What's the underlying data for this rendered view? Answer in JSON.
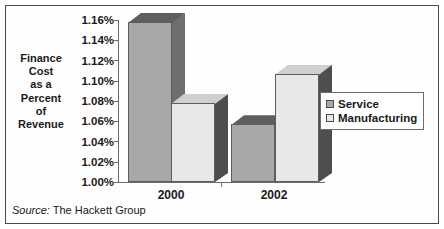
{
  "chart_data": {
    "type": "bar",
    "title": "",
    "subtitle": "",
    "xlabel": "",
    "ylabel": "Finance Cost as a Percent of Revenue",
    "ylabel_lines": [
      "Finance",
      "Cost",
      "as a",
      "Percent",
      "of",
      "Revenue"
    ],
    "categories": [
      "2000",
      "2002"
    ],
    "series": [
      {
        "name": "Service",
        "values": [
          1.158,
          1.057
        ],
        "color": "#a8a8a8"
      },
      {
        "name": "Manufacturing",
        "values": [
          1.078,
          1.107
        ],
        "color": "#e8e8e8"
      }
    ],
    "ylim": [
      1.0,
      1.16
    ],
    "ytick_values": [
      1.16,
      1.14,
      1.12,
      1.1,
      1.08,
      1.06,
      1.04,
      1.02,
      1.0
    ],
    "ytick_labels": [
      "1.16%",
      "1.14%",
      "1.12%",
      "1.10%",
      "1.08%",
      "1.06%",
      "1.04%",
      "1.02%",
      "1.00%"
    ],
    "ytick_step": 0.02,
    "grid": false,
    "legend_position": "right",
    "three_d": true
  },
  "legend": {
    "entries": [
      {
        "label": "Service",
        "color": "#a8a8a8"
      },
      {
        "label": "Manufacturing",
        "color": "#e8e8e8"
      }
    ]
  },
  "source": {
    "lead": "Source:",
    "text": " The Hackett Group"
  },
  "colors": {
    "service_front": "#a8a8a8",
    "service_side": "#6e6e6e",
    "service_top": "#5e5e5e",
    "manufacturing_front": "#e8e8e8",
    "manufacturing_side": "#4e4e4e",
    "manufacturing_top": "#d0d0d0",
    "axis": "#6d6d6d",
    "border": "#4a4a4a",
    "text": "#1a1a1a",
    "background": "#ffffff"
  }
}
